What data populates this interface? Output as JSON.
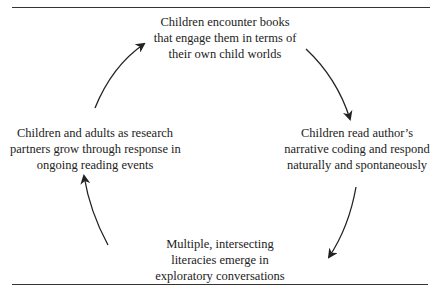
{
  "diagram": {
    "type": "cycle",
    "nodes": [
      {
        "id": "top",
        "lines": [
          "Children encounter books",
          "that engage them in terms of",
          "their own child worlds"
        ]
      },
      {
        "id": "right",
        "lines": [
          "Children read author’s",
          "narrative coding and respond",
          "naturally and spontaneously"
        ]
      },
      {
        "id": "bottom",
        "lines": [
          "Multiple, intersecting",
          "literacies emerge in",
          "exploratory conversations"
        ]
      },
      {
        "id": "left",
        "lines": [
          "Children and adults as research",
          "partners grow through response in",
          "ongoing reading events"
        ]
      }
    ],
    "edges": [
      {
        "from": "top",
        "to": "right"
      },
      {
        "from": "right",
        "to": "bottom"
      },
      {
        "from": "bottom",
        "to": "left"
      },
      {
        "from": "left",
        "to": "top"
      }
    ],
    "colors": {
      "line": "#222222",
      "text": "#222222",
      "background": "#ffffff"
    }
  }
}
